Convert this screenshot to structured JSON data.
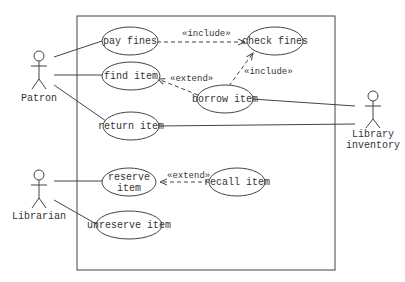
{
  "diagram": {
    "type": "uml-use-case",
    "colors": {
      "line": "#444444",
      "text": "#333333",
      "background": "#ffffff"
    },
    "actors": [
      {
        "id": "patron",
        "label": "Patron"
      },
      {
        "id": "librarian",
        "label": "Librarian"
      },
      {
        "id": "library_inventory",
        "label_line1": "Library",
        "label_line2": "inventory"
      }
    ],
    "use_cases": [
      {
        "id": "pay_fines",
        "label": "pay fines"
      },
      {
        "id": "check_fines",
        "label": "check fines"
      },
      {
        "id": "find_item",
        "label": "find item"
      },
      {
        "id": "borrow_item",
        "label": "borrow item"
      },
      {
        "id": "return_item",
        "label": "return item"
      },
      {
        "id": "reserve_item",
        "label_line1": "reserve",
        "label_line2": "item"
      },
      {
        "id": "recall_item",
        "label": "recall item"
      },
      {
        "id": "unreserve_item",
        "label": "unreserve item"
      }
    ],
    "relations": [
      {
        "from": "pay_fines",
        "to": "check_fines",
        "label": "«include»"
      },
      {
        "from": "borrow_item",
        "to": "check_fines",
        "label": "«include»"
      },
      {
        "from": "borrow_item",
        "to": "find_item",
        "label": "«extend»"
      },
      {
        "from": "recall_item",
        "to": "reserve_item",
        "label": "«extend»"
      }
    ],
    "associations": [
      [
        "patron",
        "pay_fines"
      ],
      [
        "patron",
        "find_item"
      ],
      [
        "patron",
        "return_item"
      ],
      [
        "librarian",
        "reserve_item"
      ],
      [
        "librarian",
        "unreserve_item"
      ],
      [
        "library_inventory",
        "borrow_item"
      ],
      [
        "library_inventory",
        "return_item"
      ]
    ]
  }
}
